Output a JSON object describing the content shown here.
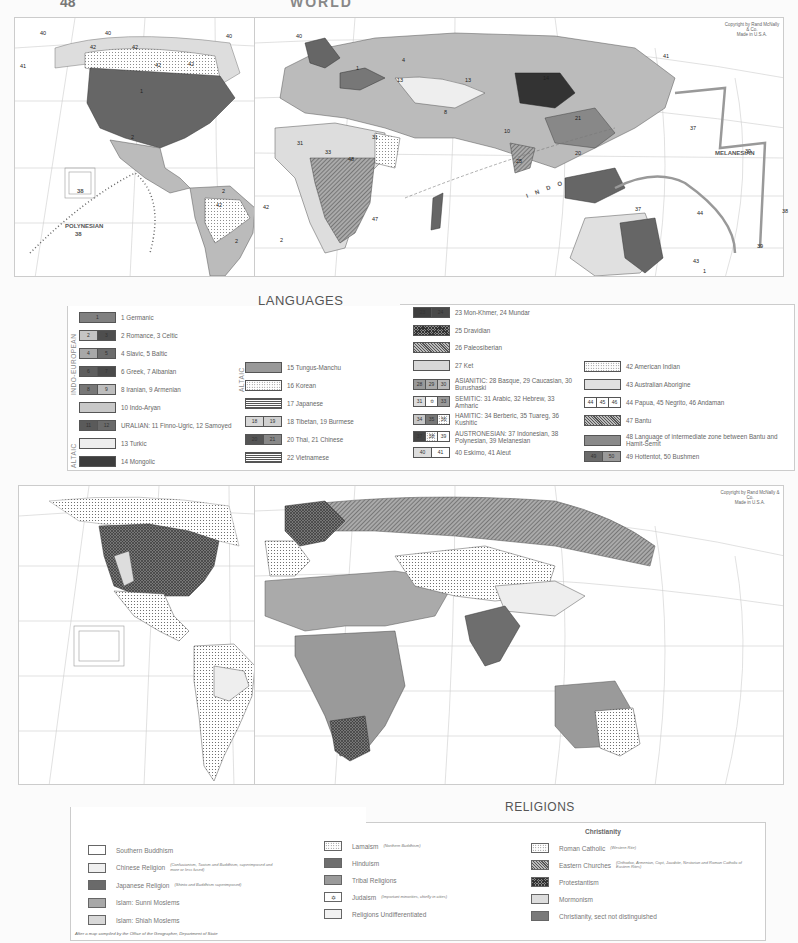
{
  "page": {
    "number": "48",
    "heading": "WORLD"
  },
  "languages_map": {
    "title": "LANGUAGES",
    "subtitle_by": "BY",
    "author": "BOGDAN ZABORSKI",
    "copyright": [
      "Copyright by Rand McNally & Co.",
      "Made in U.S.A."
    ],
    "region_labels": {
      "polynesian": "POLYNESIAN",
      "polynesian_num": "38",
      "melanesian": "MELANESIAN",
      "polynesian_vertical": "POLYNESIAN",
      "indo": "I N D O",
      "inset_num": "38",
      "tropic_cancer": "Tropic of Cancer",
      "tropic_capricorn": "Tropic of Capricorn",
      "equator": "Equator"
    },
    "map_numbers": [
      {
        "n": "40",
        "x": 40,
        "y": 30
      },
      {
        "n": "40",
        "x": 105,
        "y": 30
      },
      {
        "n": "42",
        "x": 90,
        "y": 44
      },
      {
        "n": "42",
        "x": 132,
        "y": 44
      },
      {
        "n": "42",
        "x": 155,
        "y": 62
      },
      {
        "n": "42",
        "x": 188,
        "y": 61
      },
      {
        "n": "40",
        "x": 226,
        "y": 33
      },
      {
        "n": "41",
        "x": 20,
        "y": 63
      },
      {
        "n": "1",
        "x": 140,
        "y": 88
      },
      {
        "n": "2",
        "x": 131,
        "y": 134
      },
      {
        "n": "2",
        "x": 222,
        "y": 188
      },
      {
        "n": "42",
        "x": 216,
        "y": 202
      },
      {
        "n": "42",
        "x": 263,
        "y": 204
      },
      {
        "n": "2",
        "x": 235,
        "y": 238
      },
      {
        "n": "2",
        "x": 280,
        "y": 237
      },
      {
        "n": "40",
        "x": 296,
        "y": 33
      },
      {
        "n": "1",
        "x": 356,
        "y": 65
      },
      {
        "n": "4",
        "x": 402,
        "y": 57
      },
      {
        "n": "13",
        "x": 397,
        "y": 77
      },
      {
        "n": "13",
        "x": 465,
        "y": 77
      },
      {
        "n": "14",
        "x": 543,
        "y": 75
      },
      {
        "n": "21",
        "x": 575,
        "y": 115
      },
      {
        "n": "8",
        "x": 444,
        "y": 109
      },
      {
        "n": "31",
        "x": 297,
        "y": 140
      },
      {
        "n": "31",
        "x": 372,
        "y": 134
      },
      {
        "n": "33",
        "x": 325,
        "y": 149
      },
      {
        "n": "48",
        "x": 348,
        "y": 156
      },
      {
        "n": "47",
        "x": 372,
        "y": 216
      },
      {
        "n": "10",
        "x": 504,
        "y": 128
      },
      {
        "n": "25",
        "x": 516,
        "y": 158
      },
      {
        "n": "20",
        "x": 575,
        "y": 150
      },
      {
        "n": "37",
        "x": 635,
        "y": 206
      },
      {
        "n": "37",
        "x": 690,
        "y": 125
      },
      {
        "n": "39",
        "x": 745,
        "y": 148
      },
      {
        "n": "44",
        "x": 697,
        "y": 210
      },
      {
        "n": "43",
        "x": 693,
        "y": 258
      },
      {
        "n": "1",
        "x": 703,
        "y": 268
      },
      {
        "n": "39",
        "x": 757,
        "y": 243
      },
      {
        "n": "38",
        "x": 782,
        "y": 208
      },
      {
        "n": "41",
        "x": 663,
        "y": 53
      }
    ],
    "legend": {
      "group_indo_european": "INDO-EUROPEAN",
      "group_altaic_1": "ALTAIC",
      "group_altaic_2": "ALTAIC",
      "col1": [
        {
          "swatches": [
            "1"
          ],
          "label": "1  Germanic",
          "fills": [
            "#808080"
          ]
        },
        {
          "swatches": [
            "2",
            "3"
          ],
          "label": "2 Romance, 3 Celtic",
          "fills": [
            "#c4c4c4",
            "#4e4e4e"
          ]
        },
        {
          "swatches": [
            "4",
            "5"
          ],
          "label": "4 Slavic, 5 Baltic",
          "fills": [
            "#a8a8a8",
            "#6c6c6c"
          ]
        },
        {
          "swatches": [
            "6",
            "7"
          ],
          "label": "6 Greek, 7 Albanian",
          "fills": [
            "#5e5e5e",
            "#4a4a4a"
          ]
        },
        {
          "swatches": [
            "8",
            "9"
          ],
          "label": "8 Iranian, 9 Armenian",
          "fills": [
            "#777777",
            "#bdbdbd"
          ]
        },
        {
          "swatches": [
            ""
          ],
          "label": "10 Indo-Aryan",
          "fills": [
            "#c8c8c8"
          ]
        },
        {
          "swatches": [
            "11",
            "12"
          ],
          "label": "URALIAN:  11 Finno-Ugric, 12 Samoyed",
          "fills": [
            "#5a5a5a",
            "#6a6a6a"
          ]
        },
        {
          "swatches": [
            ""
          ],
          "label": "13 Turkic",
          "fills": [
            "#ededed"
          ]
        },
        {
          "swatches": [
            ""
          ],
          "label": "14 Mongolic",
          "fills": [
            "#3c3c3c"
          ]
        }
      ],
      "col2": [
        {
          "swatches": [
            ""
          ],
          "label": "15 Tungus-Manchu",
          "fills": [
            "#999999"
          ]
        },
        {
          "swatches": [
            ""
          ],
          "label": "16 Korean",
          "fills": [
            "dots"
          ]
        },
        {
          "swatches": [
            ""
          ],
          "label": "17 Japanese",
          "fills": [
            "hlines"
          ]
        },
        {
          "swatches": [
            "18",
            "19"
          ],
          "label": "18 Tibetan, 19 Burmese",
          "fills": [
            "#d8d8d8",
            "#d0d0d0"
          ]
        },
        {
          "swatches": [
            "20",
            "21"
          ],
          "label": "20 Thai,  21 Chinese",
          "fills": [
            "#555555",
            "#888888"
          ]
        },
        {
          "swatches": [
            ""
          ],
          "label": "22 Vietnamese",
          "fills": [
            "hlines"
          ]
        }
      ],
      "col3": [
        {
          "swatches": [
            "23",
            "24"
          ],
          "label": "23 Mon-Khmer,  24 Mundar",
          "fills": [
            "#3e3e3e",
            "#4a4a4a"
          ]
        },
        {
          "swatches": [
            ""
          ],
          "label": "25 Dravidian",
          "fills": [
            "xhatch"
          ]
        },
        {
          "swatches": [
            ""
          ],
          "label": "26 Paleosiberian",
          "fills": [
            "hatch"
          ]
        },
        {
          "swatches": [
            ""
          ],
          "label": "27 Ket",
          "fills": [
            "#d8d8d8"
          ]
        },
        {
          "swatches": [
            "28",
            "29",
            "30"
          ],
          "label": "ASIANITIC: 28 Basque, 29 Caucasian, 30 Burushaski",
          "fills": [
            "#999999",
            "#aaaaaa",
            "#bbbbbb"
          ]
        },
        {
          "swatches": [
            "31",
            "✡",
            "33"
          ],
          "label": "SEMITIC: 31 Arabic, 32 Hebrew, 33 Amharic",
          "fills": [
            "#dddddd",
            "#ffffff",
            "#999999"
          ]
        },
        {
          "swatches": [
            "34",
            "35",
            "36"
          ],
          "label": "HAMITIC: 34 Berberic, 35 Tuareg, 36 Kushitic",
          "fills": [
            "#c8c8c8",
            "#777777",
            "dots"
          ]
        },
        {
          "swatches": [
            "37",
            "38",
            "39"
          ],
          "label": "AUSTRONESIAN: 37 Indonesian, 38 Polynesian, 39 Melanesian",
          "fills": [
            "#444444",
            "dots",
            "#ffffff"
          ]
        },
        {
          "swatches": [
            "40",
            "41"
          ],
          "label": "40 Eskimo,   41 Aleut",
          "fills": [
            "#dddddd",
            "#ffffff"
          ]
        }
      ],
      "col4": [
        {
          "swatches": [
            ""
          ],
          "label": "42 American Indian",
          "fills": [
            "dots"
          ]
        },
        {
          "swatches": [
            ""
          ],
          "label": "43 Australian Aborigine",
          "fills": [
            "#e0e0e0"
          ]
        },
        {
          "swatches": [
            "44",
            "45",
            "46"
          ],
          "label": "44 Papua,  45 Negrito,  46 Andaman",
          "fills": [
            "#ffffff",
            "#ffffff",
            "#ffffff"
          ]
        },
        {
          "swatches": [
            ""
          ],
          "label": "47 Bantu",
          "fills": [
            "hatch"
          ]
        },
        {
          "swatches": [
            ""
          ],
          "label": "48 Language of intermediate zone between Bantu and Hamit-Semit",
          "fills": [
            "#8a8a8a"
          ]
        },
        {
          "swatches": [
            "49",
            "50"
          ],
          "label": "49 Hottentot,  50 Bushmen",
          "fills": [
            "#6a6a6a",
            "#9a9a9a"
          ]
        }
      ]
    }
  },
  "religions_map": {
    "title": "RELIGIONS",
    "copyright": [
      "Copyright by Rand McNally & Co.",
      "Made in U.S.A."
    ],
    "tropic_cancer": "Tropic of Cancer",
    "tropic_capricorn": "Tropic of Capricorn",
    "equator": "Equator",
    "credit": "After a map compiled by the Office of the Geographer, Department of State",
    "legend": {
      "col1": [
        {
          "label": "Southern Buddhism",
          "note": "",
          "fill": "#ffffff"
        },
        {
          "label": "Chinese Religion",
          "note": "(Confucianism, Taoism and Buddhism, superimposed and more or less fused)",
          "fill": "#f0f0f0"
        },
        {
          "label": "Japanese Religion",
          "note": "(Shinto and Buddhism superimposed)",
          "fill": "#6a6a6a"
        },
        {
          "label": "Islam: Sunni Moslems",
          "note": "",
          "fill": "#a8a8a8"
        },
        {
          "label": "Islam: Shiah Moslems",
          "note": "",
          "fill": "#d8d8d8"
        }
      ],
      "col2": [
        {
          "label": "Lamaism",
          "note": "(Northern Buddhism)",
          "fill": "dots"
        },
        {
          "label": "Hinduism",
          "note": "",
          "fill": "#6e6e6e"
        },
        {
          "label": "Tribal Religions",
          "note": "",
          "fill": "#9a9a9a"
        },
        {
          "label": "Judaism",
          "note": "(Important minorities, chiefly in cities)",
          "fill": "#ffffff",
          "symbol": "✡"
        },
        {
          "label": "Religions Undifferentiated",
          "note": "",
          "fill": "#f2f2f2"
        }
      ],
      "christianity_heading": "Christianity",
      "col3": [
        {
          "label": "Roman Catholic",
          "note": "(Western Rite)",
          "fill": "dots"
        },
        {
          "label": "Eastern Churches",
          "note": "(Orthodox, Armenian, Copt, Jacobite, Nestorian and Roman Catholic of Eastern Rites)",
          "fill": "hatch"
        },
        {
          "label": "Protestantism",
          "note": "",
          "fill": "xhatch"
        },
        {
          "label": "Mormonism",
          "note": "",
          "fill": "#dddddd"
        },
        {
          "label": "Christianity, sect not distinguished",
          "note": "",
          "fill": "#7a7a7a"
        }
      ]
    }
  }
}
